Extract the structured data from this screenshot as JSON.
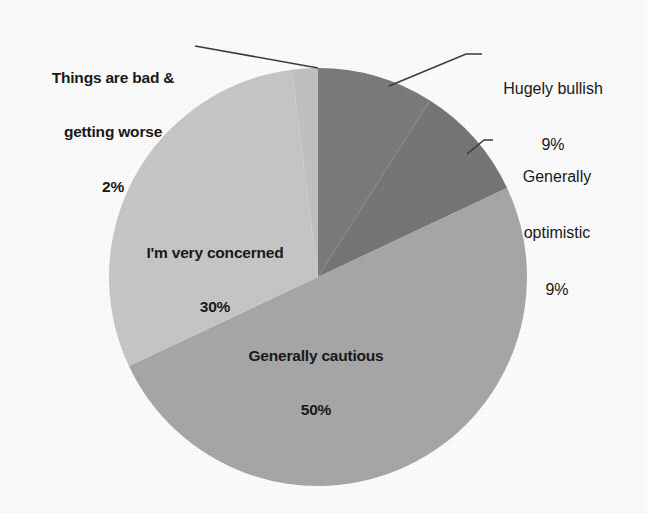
{
  "chart_data": {
    "type": "pie",
    "title": "",
    "subtitle": "",
    "xlabel": "",
    "ylabel": "",
    "legend_position": "none",
    "grid": false,
    "start_angle_deg": 0,
    "direction": "clockwise",
    "total_percent": 100,
    "categories": [
      "Hugely bullish",
      "Generally optimistic",
      "Generally cautious",
      "I'm very concerned",
      "Things are bad & getting worse"
    ],
    "values": [
      9,
      9,
      50,
      30,
      2
    ],
    "value_labels": [
      "9%",
      "9%",
      "50%",
      "30%",
      "2%"
    ],
    "slices": [
      {
        "name": "Hugely bullish",
        "label_line1": "Hugely bullish",
        "label_line2": "9%",
        "value": 9,
        "percent_text": "9%",
        "color": "#7d7d7d",
        "start_deg": 0.0,
        "end_deg": 32.4,
        "label_placement": "outside-right",
        "label_style": "regular",
        "leader_line": true
      },
      {
        "name": "Generally optimistic",
        "label_line1": "Generally",
        "label_line2": "optimistic",
        "label_line3": "9%",
        "value": 9,
        "percent_text": "9%",
        "color": "#787878",
        "start_deg": 32.4,
        "end_deg": 64.8,
        "label_placement": "outside-right",
        "label_style": "regular",
        "leader_line": true
      },
      {
        "name": "Generally cautious",
        "label_line1": "Generally cautious",
        "label_line2": "50%",
        "value": 50,
        "percent_text": "50%",
        "color": "#a9a9a9",
        "start_deg": 64.8,
        "end_deg": 244.8,
        "label_placement": "inside",
        "label_style": "bold",
        "leader_line": false
      },
      {
        "name": "I'm very concerned",
        "label_line1": "I'm very concerned",
        "label_line2": "30%",
        "value": 30,
        "percent_text": "30%",
        "color": "#c9c9c9",
        "start_deg": 244.8,
        "end_deg": 352.8,
        "label_placement": "inside",
        "label_style": "bold",
        "leader_line": false
      },
      {
        "name": "Things are bad & getting worse",
        "label_line1": "Things are bad &",
        "label_line2": "getting worse",
        "label_line3": "2%",
        "value": 2,
        "percent_text": "2%",
        "color": "#c4c4c4",
        "start_deg": 352.8,
        "end_deg": 360.0,
        "label_placement": "outside-left",
        "label_style": "bold",
        "leader_line": true
      }
    ]
  },
  "labels": {
    "bad": {
      "line1": "Things are bad &",
      "line2": "getting worse",
      "line3": "2%"
    },
    "concerned": {
      "line1": "I'm very concerned",
      "line2": "30%"
    },
    "cautious": {
      "line1": "Generally cautious",
      "line2": "50%"
    },
    "bullish": {
      "line1": "Hugely bullish",
      "line2": "9%"
    },
    "optimistic": {
      "line1": "Generally",
      "line2": "optimistic",
      "line3": "9%"
    }
  },
  "colors": {
    "background": "#ffffff",
    "text": "#1a1a1a",
    "leader_line": "#3d3d3d",
    "slice_bullish": "#7d7d7d",
    "slice_optimistic": "#787878",
    "slice_cautious": "#a9a9a9",
    "slice_concerned": "#c9c9c9",
    "slice_bad": "#c4c4c4"
  },
  "geometry": {
    "center_x": 318,
    "center_y": 277,
    "radius": 209
  }
}
